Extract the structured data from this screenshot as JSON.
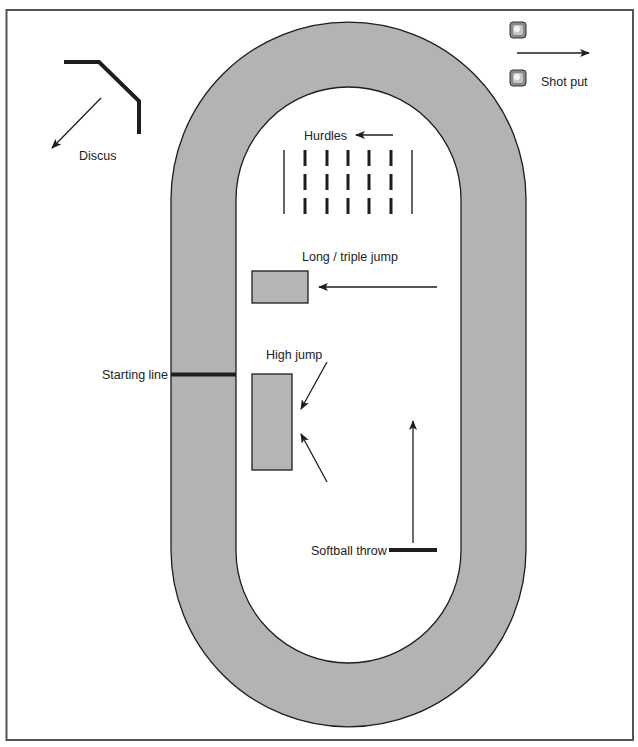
{
  "colors": {
    "track_fill": "#b3b3b3",
    "area_fill": "#b5b5b5",
    "stroke": "#1e1e1e",
    "frame": "#555555",
    "background": "#ffffff"
  },
  "labels": {
    "discus": "Discus",
    "shot_put": "Shot put",
    "hurdles": "Hurdles",
    "long_triple_jump": "Long / triple jump",
    "high_jump": "High jump",
    "starting_line": "Starting line",
    "softball_throw": "Softball throw"
  },
  "elements": {
    "track": {
      "shape": "oval",
      "lanes_fill": "gray",
      "infield": "white"
    },
    "hurdles": {
      "columns": 5,
      "rows": 3,
      "boundary_lines": 2
    },
    "shot_put": {
      "circles": 2
    },
    "high_jump": {
      "approach_arrows": 2
    },
    "long_triple_jump": {
      "approach_arrows": 1
    },
    "softball_throw": {
      "direction": "up"
    },
    "discus": {
      "direction": "down-left"
    }
  }
}
